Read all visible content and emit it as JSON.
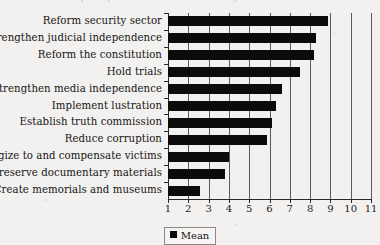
{
  "figure": {
    "background_color": "#f3f1ef",
    "bar_color": "#0b0b0b",
    "axis_color": "#2b2927",
    "title_remnant": "Popular preferences for transitional justice measures"
  },
  "legend": {
    "position": "bottom-center",
    "entries": [
      {
        "label": "Mean",
        "color": "#0b0b0b",
        "marker": "filled-square"
      }
    ]
  },
  "chart_data": {
    "type": "bar",
    "orientation": "horizontal",
    "title": "",
    "xlabel": "",
    "ylabel": "",
    "xlim": [
      1,
      11
    ],
    "xticks": [
      1,
      2,
      3,
      4,
      5,
      6,
      7,
      8,
      9,
      10,
      11
    ],
    "xticklabels": [
      "1",
      "2",
      "3",
      "4",
      "5",
      "6",
      "7",
      "8",
      "9",
      "10",
      "11"
    ],
    "grid": "vertical",
    "legend": [
      "Mean"
    ],
    "categories": [
      "Reform security sector",
      "Strengthen judicial independence",
      "Reform the constitution",
      "Hold trials",
      "Strengthen media independence",
      "Implement lustration",
      "Establish truth commission",
      "Reduce corruption",
      "Apologize to and compensate victims",
      "Preserve documentary materials",
      "Create memorials and museums"
    ],
    "series": [
      {
        "name": "Mean",
        "values": [
          8.9,
          8.3,
          8.2,
          7.5,
          6.6,
          6.3,
          6.1,
          5.9,
          4.0,
          3.8,
          2.6
        ]
      }
    ]
  }
}
